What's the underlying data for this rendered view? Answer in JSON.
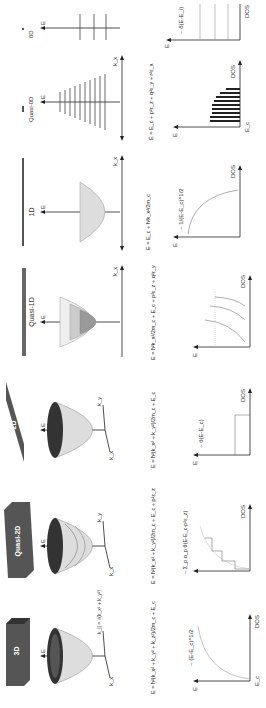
{
  "figure": {
    "orientation": "rotated 90 degrees counter-clockwise",
    "columns": [
      {
        "name": "3D",
        "header": "3D",
        "dispersion_axes": {
          "e": "E",
          "k1": "k_x",
          "k2": "k_|| = √(k_x² + k_y²)"
        },
        "equation": "E = ħ²(k_x² + k_y² + k_z²)/2m_c + E_c",
        "dos_label": "~ (E-E_c)^1/2",
        "dos_axes": {
          "y": "E",
          "x": "DOS",
          "origin": "E_c"
        }
      },
      {
        "name": "Quasi-2D",
        "header": "Quasi-2D",
        "dispersion_axes": {
          "e": "E",
          "k1": "k_x",
          "k2": "k_y"
        },
        "subband_labels": [
          "p1",
          "p2",
          "p3"
        ],
        "equation": "E = ħ²(k_x² + k_y²)/2m_c + E_c + p²ε_z",
        "dos_label": "~ Σ_p α_p θ(E-E_c-p²ε_z)",
        "dos_axes": {
          "y": "E",
          "x": "DOS"
        }
      },
      {
        "name": "2D",
        "header": "2D",
        "dispersion_axes": {
          "e": "E",
          "k1": "k_x",
          "k2": "k_y"
        },
        "equation": "E = ħ²(k_x² + k_y²)/2m_c + E_c",
        "dos_label": "~ θ(E-E_c)",
        "dos_axes": {
          "y": "E",
          "x": "DOS"
        }
      },
      {
        "name": "Quasi-1D",
        "header": "Quasi-1D",
        "dispersion_axes": {
          "e": "E",
          "k1": "k_x"
        },
        "equation": "E = ħ²k_x²/2m_c + E_c + p²ε_z + q²ε_y",
        "dos_axes": {
          "y": "E",
          "x": "DOS"
        }
      },
      {
        "name": "1D",
        "header": "1D",
        "dispersion_axes": {
          "e": "E",
          "k1": "k_x"
        },
        "equation": "E = E_c + ħ²k_x²/2m_c",
        "dos_label": "~ 1/(E-E_c)^1/2",
        "dos_axes": {
          "y": "E",
          "x": "DOS"
        }
      },
      {
        "name": "Quasi-0D",
        "header": "Quasi-0D",
        "dispersion_axes": {
          "e": "E",
          "k1": "k_x"
        },
        "equation": "E = E_c + p²ε_z + q²ε_y + r²ε_x",
        "dos_axes": {
          "y": "E",
          "x": "DOS",
          "origin": "E_c"
        }
      },
      {
        "name": "0D",
        "header": "0D",
        "dispersion_axes": {
          "e": "E"
        },
        "dos_label": "~ δ(E-E_i)",
        "dos_axes": {
          "y": "E",
          "x": "DOS"
        }
      }
    ]
  }
}
